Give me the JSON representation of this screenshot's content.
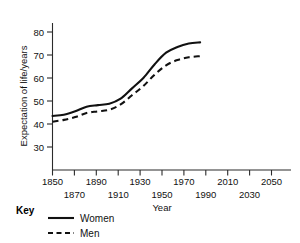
{
  "chart_data": {
    "type": "line",
    "title": "",
    "xlabel": "Year",
    "ylabel": "Expectation of life/years",
    "xlim": [
      1850,
      2060
    ],
    "ylim": [
      25,
      83
    ],
    "grid": false,
    "legend_position": "below-left",
    "legend_title": "Key",
    "x_ticks_upper": [
      "1850",
      "1890",
      "1930",
      "1970",
      "2010",
      "2050"
    ],
    "x_ticks_lower": [
      "1870",
      "1910",
      "1950",
      "1990",
      "2030"
    ],
    "x_tick_values_upper": [
      1850,
      1890,
      1930,
      1970,
      2010,
      2050
    ],
    "x_tick_values_lower": [
      1870,
      1910,
      1950,
      1990,
      2030
    ],
    "y_ticks": [
      "30",
      "40",
      "50",
      "60",
      "70",
      "80"
    ],
    "y_tick_values": [
      30,
      40,
      50,
      60,
      70,
      80
    ],
    "series": [
      {
        "name": "Women",
        "style": "solid",
        "color": "#111111",
        "x": [
          1850,
          1860,
          1870,
          1880,
          1890,
          1900,
          1910,
          1920,
          1930,
          1940,
          1950,
          1960,
          1970,
          1980
        ],
        "values": [
          43.5,
          44.0,
          45.5,
          47.5,
          48.2,
          48.8,
          51.0,
          55.5,
          60.0,
          66.0,
          71.0,
          73.5,
          75.0,
          75.5
        ]
      },
      {
        "name": "Men",
        "style": "dashed",
        "color": "#111111",
        "x": [
          1850,
          1860,
          1870,
          1880,
          1890,
          1900,
          1910,
          1920,
          1930,
          1940,
          1950,
          1960,
          1970,
          1980
        ],
        "values": [
          41.0,
          41.8,
          43.0,
          44.8,
          45.5,
          46.2,
          48.5,
          52.5,
          56.5,
          61.5,
          65.5,
          67.8,
          69.0,
          69.5
        ]
      }
    ]
  },
  "axes": {
    "y_title": "Expectation of life/years",
    "x_title": "Year"
  },
  "key": {
    "title": "Key",
    "entries": [
      {
        "label": "Women",
        "style": "solid"
      },
      {
        "label": "Men",
        "style": "dashed"
      }
    ]
  }
}
